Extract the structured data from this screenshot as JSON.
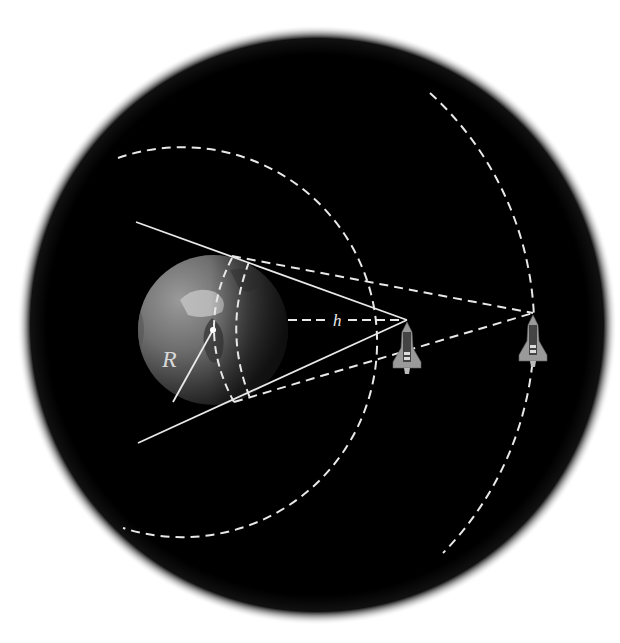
{
  "diagram": {
    "labels": {
      "radius": "R",
      "height": "h"
    },
    "colors": {
      "background": "#ffffff",
      "space": "#000000",
      "lines": "#e8e8e8",
      "earth_light": "#8a8a8a",
      "earth_dark": "#2a2a2a"
    },
    "elements": {
      "earth": "Earth sphere with center point and radius R",
      "shuttle_near": "Space shuttle at altitude h",
      "shuttle_far": "Space shuttle at higher altitude",
      "tangent_lines": "Solid lines from near shuttle tangent to Earth",
      "sight_lines": "Dashed lines from far shuttle tangent to Earth",
      "orbit_near": "Dashed circular orbit through near shuttle",
      "orbit_far": "Dashed circular orbit through far shuttle",
      "horizon_near": "Dashed horizon circle on Earth for near shuttle",
      "horizon_far": "Dashed horizon circle on Earth for far shuttle"
    }
  }
}
